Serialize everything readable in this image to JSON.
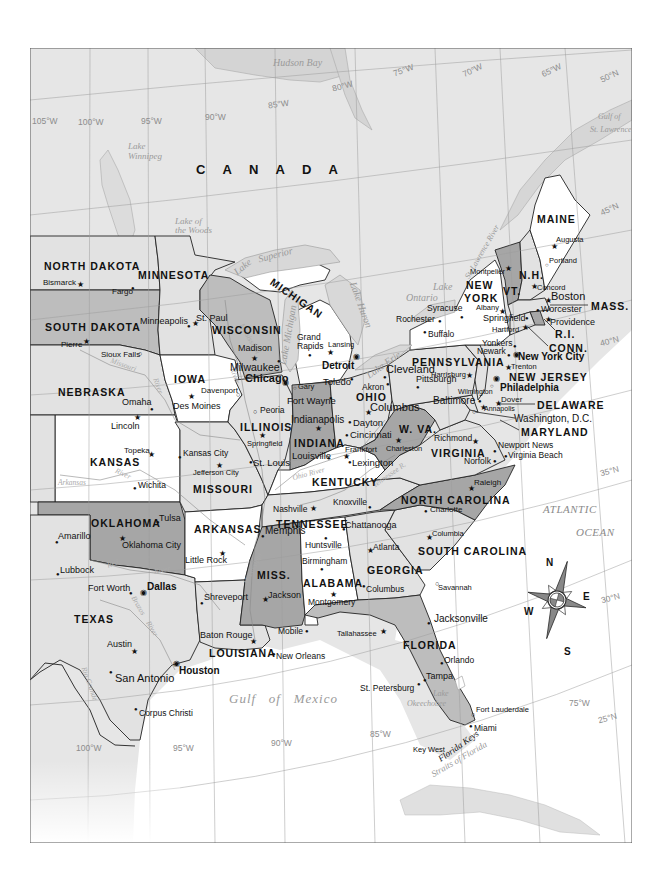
{
  "map": {
    "colors": {
      "land_foreign": "#e6e6e6",
      "state_white": "#ffffff",
      "state_light": "#e2e2e2",
      "state_medium": "#bdbdbd",
      "state_dark": "#a6a6a6",
      "water": "#ffffff",
      "lakes": "#d8d8d8",
      "border": "#222222",
      "graticule": "#9c9c9c"
    },
    "countries": {
      "canada": "C A N A D A"
    },
    "states": {
      "north_dakota": "NORTH DAKOTA",
      "south_dakota": "SOUTH DAKOTA",
      "nebraska": "NEBRASKA",
      "kansas": "KANSAS",
      "oklahoma": "OKLAHOMA",
      "texas": "TEXAS",
      "minnesota": "MINNESOTA",
      "iowa": "IOWA",
      "missouri": "MISSOURI",
      "arkansas": "ARKANSAS",
      "louisiana": "LOUISIANA",
      "wisconsin": "WISCONSIN",
      "illinois": "ILLINOIS",
      "michigan": "MICHIGAN",
      "indiana": "INDIANA",
      "ohio": "OHIO",
      "kentucky": "KENTUCKY",
      "tennessee": "TENNESSEE",
      "mississippi": "MISS.",
      "alabama": "ALABAMA",
      "georgia": "GEORGIA",
      "florida": "FLORIDA",
      "south_carolina": "SOUTH CAROLINA",
      "north_carolina": "NORTH CAROLINA",
      "virginia": "VIRGINIA",
      "west_virginia": "W. VA.",
      "maryland": "MARYLAND",
      "delaware": "DELAWARE",
      "new_jersey": "NEW JERSEY",
      "pennsylvania": "PENNSYLVANIA",
      "new_york_1": "NEW",
      "new_york_2": "YORK",
      "vermont": "VT.",
      "new_hampshire": "N.H.",
      "maine": "MAINE",
      "massachusetts": "MASS.",
      "rhode_island": "R.I.",
      "connecticut": "CONN."
    },
    "cities": {
      "bismarck": "Bismarck",
      "fargo": "Fargo",
      "pierre": "Pierre",
      "sioux_falls": "Sioux Falls",
      "minneapolis": "Minneapolis",
      "st_paul": "St. Paul",
      "madison": "Madison",
      "milwaukee": "Milwaukee",
      "chicago": "Chicago",
      "omaha": "Omaha",
      "lincoln": "Lincoln",
      "davenport": "Davenport",
      "des_moines": "Des Moines",
      "peoria": "Peoria",
      "springfield_il": "Springfield",
      "topeka": "Topeka",
      "wichita": "Wichita",
      "kansas_city": "Kansas City",
      "jefferson_city": "Jefferson City",
      "st_louis": "St. Louis",
      "tulsa": "Tulsa",
      "oklahoma_city": "Oklahoma City",
      "amarillo": "Amarillo",
      "lubbock": "Lubbock",
      "fort_worth": "Fort Worth",
      "dallas": "Dallas",
      "austin": "Austin",
      "san_antonio": "San Antonio",
      "houston": "Houston",
      "corpus_christi": "Corpus Christi",
      "little_rock": "Little Rock",
      "shreveport": "Shreveport",
      "baton_rouge": "Baton Rouge",
      "new_orleans": "New Orleans",
      "memphis": "Memphis",
      "jackson": "Jackson",
      "mobile": "Mobile",
      "nashville": "Nashville",
      "knoxville": "Knoxville",
      "chattanooga": "Chattanooga",
      "huntsville": "Huntsville",
      "birmingham": "Birmingham",
      "montgomery": "Montgomery",
      "atlanta": "Atlanta",
      "columbus_ga": "Columbus",
      "savannah": "Savannah",
      "tallahassee": "Tallahassee",
      "jacksonville": "Jacksonville",
      "orlando": "Orlando",
      "tampa": "Tampa",
      "st_petersburg": "St. Petersburg",
      "fort_lauderdale": "Fort Lauderdale",
      "miami": "Miami",
      "key_west": "Key West",
      "columbia": "Columbia",
      "charlotte": "Charlotte",
      "raleigh": "Raleigh",
      "richmond": "Richmond",
      "norfolk": "Norfolk",
      "newport_news": "Newport News",
      "virginia_beach": "Virginia Beach",
      "charleston": "Charleston",
      "louisville": "Louisville",
      "frankfort": "Frankfort",
      "lexington": "Lexington",
      "cincinnati": "Cincinnati",
      "dayton": "Dayton",
      "columbus_oh": "Columbus",
      "indianapolis": "Indianapolis",
      "fort_wayne": "Fort Wayne",
      "gary": "Gary",
      "toledo": "Toledo",
      "akron": "Akron",
      "cleveland": "Cleveland",
      "detroit": "Detroit",
      "lansing": "Lansing",
      "grand_rapids_1": "Grand",
      "grand_rapids_2": "Rapids",
      "pittsburgh": "Pittsburgh",
      "harrisburg": "Harrisburg",
      "philadelphia": "Philadelphia",
      "wilmington": "Wilmington",
      "dover": "Dover",
      "baltimore": "Baltimore",
      "annapolis": "Annapolis",
      "washington_dc": "Washington, D.C.",
      "trenton": "Trenton",
      "newark": "Newark",
      "new_york_city": "New York City",
      "yonkers": "Yonkers",
      "buffalo": "Buffalo",
      "rochester": "Rochester",
      "syracuse": "Syracuse",
      "albany": "Albany",
      "montpelier": "Montpelier",
      "concord": "Concord",
      "augusta": "Augusta",
      "portland": "Portland",
      "boston": "Boston",
      "worcester": "Worcester",
      "springfield_ma": "Springfield",
      "hartford": "Hartford",
      "providence": "Providence"
    },
    "water_bodies": {
      "hudson_bay": "Hudson Bay",
      "lake_winnipeg_1": "Lake",
      "lake_winnipeg_2": "Winnipeg",
      "lake_of_the_woods_1": "Lake of",
      "lake_of_the_woods_2": "the Woods",
      "lake_superior_1": "Lake",
      "lake_superior_2": "Superior",
      "lake_michigan": "Lake Michigan",
      "lake_huron": "Lake Huron",
      "lake_erie": "Lake Erie",
      "lake_ontario_1": "Lake",
      "lake_ontario_2": "Ontario",
      "gulf_st_lawrence_1": "Gulf of",
      "gulf_st_lawrence_2": "St. Lawrence",
      "st_lawrence_river": "St. Lawrence River",
      "gulf_of_mexico": "Gulf   of   Mexico",
      "atlantic_1": "ATLANTIC",
      "atlantic_2": "OCEAN",
      "lake_okeechobee_1": "Lake",
      "lake_okeechobee_2": "Okeechobee",
      "straits_of_florida": "Straits of Florida",
      "florida_keys": "Florida Keys"
    },
    "rivers": {
      "missouri": "Missouri",
      "mississippi": "Mississippi",
      "mississippi_river": "River",
      "ohio": "Ohio River",
      "tennessee": "Tennessee R.",
      "arkansas_1": "Arkansas",
      "arkansas_2": "River",
      "red_1": "Red",
      "red_2": "River",
      "brazos_1": "Brazos",
      "brazos_2": "River",
      "rio_grande": "Rio Grande",
      "missouri_river": "River"
    },
    "graticule": {
      "w105": "105°W",
      "w100_top": "100°W",
      "w95_top": "95°W",
      "w90_top": "90°W",
      "w85_top": "85°W",
      "w80_top": "80°W",
      "w75_top": "75°W",
      "w70_top": "70°W",
      "w65_top": "65°W",
      "n50": "50°N",
      "n45": "45°N",
      "n40": "40°N",
      "n35": "35°N",
      "n30": "30°N",
      "n25": "25°N",
      "w100_bot": "100°W",
      "w95_bot": "95°W",
      "w90_bot": "90°W",
      "w85_bot": "85°W",
      "w75_bot": "75°W"
    },
    "compass": {
      "n": "N",
      "s": "S",
      "e": "E",
      "w": "W"
    },
    "symbols": {
      "capital": "★",
      "city": "●",
      "town": "○",
      "major": "◉"
    }
  }
}
